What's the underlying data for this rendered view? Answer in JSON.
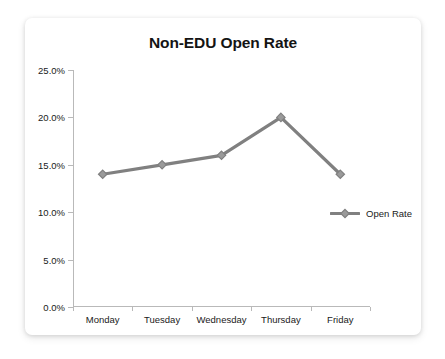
{
  "chart_data": {
    "type": "line",
    "title": "Non-EDU Open Rate",
    "xlabel": "",
    "ylabel": "",
    "categories": [
      "Monday",
      "Tuesday",
      "Wednesday",
      "Thursday",
      "Friday"
    ],
    "series": [
      {
        "name": "Open Rate",
        "values": [
          14.0,
          15.0,
          16.0,
          20.0,
          14.0
        ]
      }
    ],
    "ylim": [
      0.0,
      25.0
    ],
    "ytick_values": [
      0.0,
      5.0,
      10.0,
      15.0,
      20.0,
      25.0
    ],
    "ytick_labels": [
      "0.0%",
      "5.0%",
      "10.0%",
      "15.0%",
      "20.0%",
      "25.0%"
    ],
    "grid": false,
    "legend_position": "right",
    "series_color": "#808080",
    "axis_color": "#b9b9b9",
    "text_color": "#1a1a1a",
    "marker": "diamond"
  }
}
